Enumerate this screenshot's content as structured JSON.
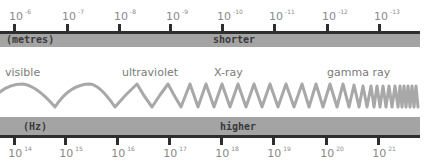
{
  "wavelength_axis": {
    "unit_label": "(metres)",
    "direction_label": "shorter",
    "ticks": [
      {
        "base": "10",
        "exp": "-6"
      },
      {
        "base": "10",
        "exp": "-7"
      },
      {
        "base": "10",
        "exp": "-8"
      },
      {
        "base": "10",
        "exp": "-9"
      },
      {
        "base": "10",
        "exp": "-10"
      },
      {
        "base": "10",
        "exp": "-11"
      },
      {
        "base": "10",
        "exp": "-12"
      },
      {
        "base": "10",
        "exp": "-13"
      }
    ]
  },
  "bands": [
    {
      "label": "visible"
    },
    {
      "label": "ultraviolet"
    },
    {
      "label": "X-ray"
    },
    {
      "label": "gamma ray"
    }
  ],
  "frequency_axis": {
    "unit_label": "(Hz)",
    "direction_label": "higher",
    "ticks": [
      {
        "base": "10",
        "exp": "14"
      },
      {
        "base": "10",
        "exp": "15"
      },
      {
        "base": "10",
        "exp": "16"
      },
      {
        "base": "10",
        "exp": "17"
      },
      {
        "base": "10",
        "exp": "18"
      },
      {
        "base": "10",
        "exp": "19"
      },
      {
        "base": "10",
        "exp": "20"
      },
      {
        "base": "10",
        "exp": "21"
      }
    ]
  },
  "colors": {
    "bar_fill": "#a4a4a4",
    "bar_line": "#2e2e2e",
    "wave": "#a8a8a8",
    "text": "#7a7a7a"
  }
}
